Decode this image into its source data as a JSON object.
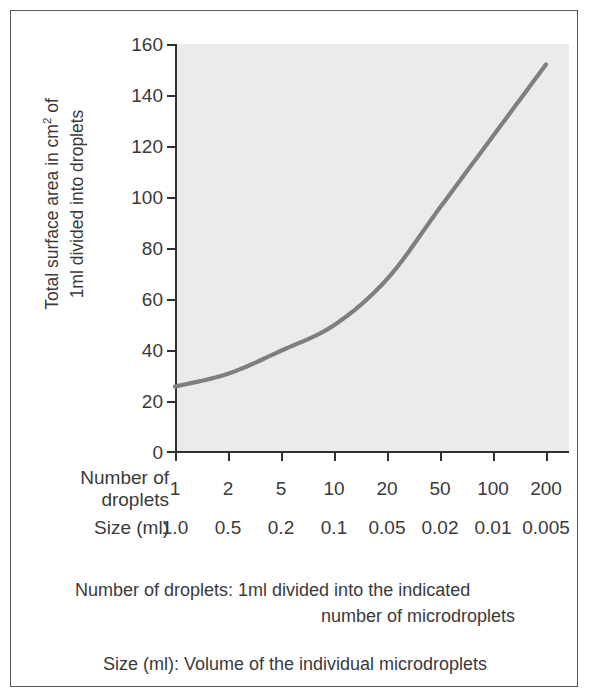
{
  "figure": {
    "background_color": "#ffffff",
    "border_color": "#55585c",
    "plot_background_color": "#ebebeb",
    "curve_color": "#7d7f81",
    "axis_color": "#2f3133",
    "text_color": "#3a3a3a"
  },
  "axes": {
    "y_title_line1": "Total surface area in cm",
    "y_title_superscript": "2",
    "y_title_line1_tail": " of",
    "y_title_line2": "1ml divided into droplets",
    "y_ticks": [
      "160",
      "140",
      "120",
      "100",
      "80",
      "60",
      "40",
      "20",
      "0"
    ],
    "y_tick_values": [
      160,
      140,
      120,
      100,
      80,
      60,
      40,
      20,
      0
    ]
  },
  "x_table": {
    "row1_label_line1": "Number of",
    "row1_label_line2": "droplets",
    "row1_values": [
      "1",
      "2",
      "5",
      "10",
      "20",
      "50",
      "100",
      "200"
    ],
    "row2_label": "Size (ml)",
    "row2_values": [
      "1.0",
      "0.5",
      "0.2",
      "0.1",
      "0.05",
      "0.02",
      "0.01",
      "0.005"
    ]
  },
  "captions": {
    "caption1_line1": "Number of droplets: 1ml divided into the indicated",
    "caption1_line2": "number of microdroplets",
    "caption2": "Size (ml): Volume of the individual microdroplets"
  },
  "chart_data": {
    "type": "line",
    "title": "",
    "xlabel": "Number of droplets",
    "ylabel": "Total surface area in cm2 of 1ml divided into droplets",
    "x_categories": [
      "1",
      "2",
      "5",
      "10",
      "20",
      "50",
      "100",
      "200"
    ],
    "x_secondary_label": "Size (ml)",
    "x_secondary_categories": [
      "1.0",
      "0.5",
      "0.2",
      "0.1",
      "0.05",
      "0.02",
      "0.01",
      "0.005"
    ],
    "ylim": [
      0,
      160
    ],
    "ytick_step": 20,
    "grid": false,
    "legend": "none",
    "series": [
      {
        "name": "Total surface area",
        "values": [
          26,
          31,
          40,
          50,
          68,
          96,
          124,
          152
        ]
      }
    ]
  }
}
